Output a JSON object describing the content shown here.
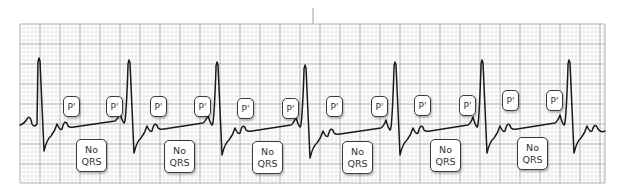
{
  "diagram": {
    "type": "ecg-rhythm-strip",
    "colors": {
      "background": "#ffffff",
      "grid_minor": "#d6d6d6",
      "grid_major": "#a8a8a8",
      "trace": "#1a1a1a",
      "label_border": "#3a3a3a",
      "label_text": "#333333"
    },
    "grid": {
      "left": 20,
      "top": 24,
      "right": 605,
      "bottom": 183,
      "minor": 4,
      "major": 20
    },
    "top_marker": {
      "x": 313,
      "y1": 8,
      "y2": 24
    },
    "r_peaks": [
      {
        "x": 39,
        "y": 58
      },
      {
        "x": 129,
        "y": 60
      },
      {
        "x": 217,
        "y": 62
      },
      {
        "x": 305,
        "y": 65
      },
      {
        "x": 395,
        "y": 62
      },
      {
        "x": 482,
        "y": 60
      },
      {
        "x": 569,
        "y": 60
      }
    ],
    "labels": {
      "p_prime": "P'",
      "no_qrs_line1": "No",
      "no_qrs_line2": "QRS"
    },
    "groups": [
      {
        "p1": {
          "x": 63,
          "y": 96
        },
        "p2": {
          "x": 106,
          "y": 96
        },
        "no_qrs": {
          "x": 76,
          "y": 139
        }
      },
      {
        "p1": {
          "x": 150,
          "y": 96
        },
        "p2": {
          "x": 194,
          "y": 96
        },
        "no_qrs": {
          "x": 164,
          "y": 140
        }
      },
      {
        "p1": {
          "x": 237,
          "y": 98
        },
        "p2": {
          "x": 282,
          "y": 98
        },
        "no_qrs": {
          "x": 252,
          "y": 141
        }
      },
      {
        "p1": {
          "x": 326,
          "y": 96
        },
        "p2": {
          "x": 371,
          "y": 96
        },
        "no_qrs": {
          "x": 342,
          "y": 141
        }
      },
      {
        "p1": {
          "x": 414,
          "y": 95
        },
        "p2": {
          "x": 459,
          "y": 95
        },
        "no_qrs": {
          "x": 430,
          "y": 139
        }
      },
      {
        "p1": {
          "x": 502,
          "y": 90
        },
        "p2": {
          "x": 546,
          "y": 90
        },
        "no_qrs": {
          "x": 517,
          "y": 137
        }
      }
    ]
  }
}
